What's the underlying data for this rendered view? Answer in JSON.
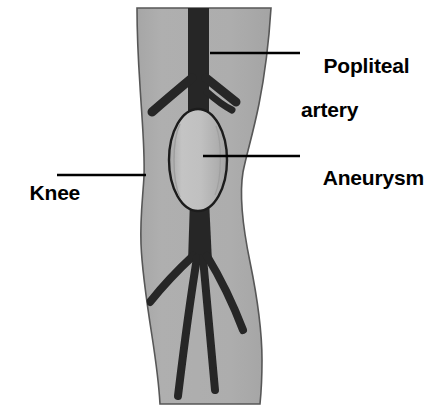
{
  "figure": {
    "title": "Popliteal artery aneurysm",
    "type": "anatomical-illustration",
    "background_color": "#ffffff"
  },
  "colors": {
    "leg_fill": "#ababab",
    "leg_outline": "#555555",
    "artery_fill": "#262626",
    "aneurysm_fill": "#bcbcbc",
    "aneurysm_outline": "#1c1c1c",
    "aneurysm_highlight": "#9a9a9a",
    "leader_line": "#000000",
    "label_text": "#000000"
  },
  "labels": {
    "popliteal_artery": {
      "line1": "Popliteal",
      "line2": "artery",
      "full": "Popliteal artery"
    },
    "aneurysm": {
      "line1": "Aneurysm",
      "full": "Aneurysm"
    },
    "knee": {
      "line1": "Knee",
      "full": "Knee"
    }
  },
  "structures": [
    {
      "name": "leg",
      "label": "Leg silhouette"
    },
    {
      "name": "popliteal-artery",
      "label": "Popliteal artery"
    },
    {
      "name": "aneurysm",
      "label": "Aneurysm"
    },
    {
      "name": "upper-artery-branches",
      "label": "Upper artery branches"
    },
    {
      "name": "lower-artery-branches",
      "label": "Lower artery branches"
    }
  ],
  "leader_lines": [
    {
      "name": "popliteal-artery-leader",
      "from_x": 210,
      "from_y": 53,
      "to_x": 300,
      "to_y": 53
    },
    {
      "name": "aneurysm-leader",
      "from_x": 203,
      "from_y": 156,
      "to_x": 300,
      "to_y": 156
    },
    {
      "name": "knee-leader",
      "from_x": 57,
      "from_y": 175,
      "to_x": 146,
      "to_y": 175
    }
  ]
}
